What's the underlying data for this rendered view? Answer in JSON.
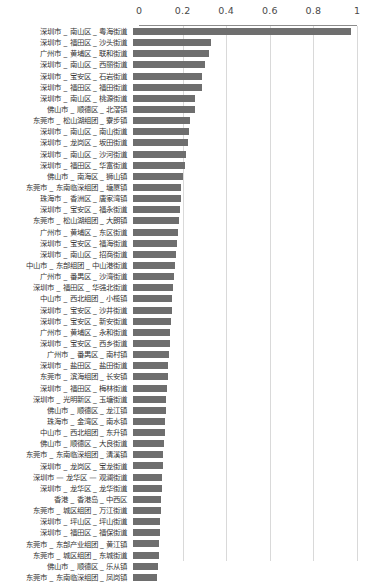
{
  "chart_data": {
    "type": "bar",
    "orientation": "horizontal",
    "title": "",
    "xlabel": "",
    "ylabel": "",
    "xlim": [
      0,
      1
    ],
    "ylim": null,
    "grid": true,
    "legend": null,
    "bar_color": "#6e6e6e",
    "axis_color": "#8c8c8c",
    "grid_color": "#d9d9d9",
    "xticks": [
      "0",
      "0.2",
      "0.4",
      "0.6",
      "0.8",
      "1"
    ],
    "xtick_values": [
      0,
      0.2,
      0.4,
      0.6,
      0.8,
      1
    ],
    "categories": [
      "深圳市 _ 南山区 _ 粤海街道",
      "深圳市 _ 福田区 _ 沙头街道",
      "广州市 _ 黄埔区 _ 联和街道",
      "深圳市 _ 南山区 _ 西丽街道",
      "深圳市 _ 宝安区 _ 石岩街道",
      "深圳市 _ 福田区 _ 福田街道",
      "深圳市 _ 南山区 _ 桃源街道",
      "佛山市 _ 顺德区 _ 北滘镇",
      "东莞市 _ 松山湖组团 _ 寮步镇",
      "深圳市 _ 南山区 _ 南山街道",
      "深圳市 _ 龙岗区 _ 坂田街道",
      "深圳市 _ 南山区 _ 沙河街道",
      "深圳市 _ 福田区 _ 华富街道",
      "佛山市 _ 南海区 _ 狮山镇",
      "东莞市 _ 东南临深组团 _ 塘厦镇",
      "珠海市 _ 香洲区 _ 唐家湾镇",
      "深圳市 _ 宝安区 _ 福永街道",
      "东莞市 _ 松山湖组团 _ 大朗镇",
      "广州市 _ 黄埔区 _ 东区街道",
      "深圳市 _ 宝安区 _ 福海街道",
      "深圳市 _ 南山区 _ 招商街道",
      "中山市 _ 东部组团 _ 中山港街道",
      "广州市 _ 番禺区 _ 沙湾街道",
      "深圳市 _ 福田区 _ 华强北街道",
      "中山市 _ 西北组团 _ 小榄镇",
      "深圳市 _ 宝安区 _ 沙井街道",
      "深圳市 _ 宝安区 _ 新安街道",
      "广州市 _ 黄埔区 _ 永和街道",
      "深圳市 _ 宝安区 _ 西乡街道",
      "广州市 _ 番禺区 _ 南村镇",
      "深圳市 _ 盐田区 _ 盐田街道",
      "东莞市 _ 滨海组团 _ 长安镇",
      "深圳市 _ 福田区 _ 梅林街道",
      "深圳市 _ 光明新区 _ 玉塘街道",
      "佛山市 _ 顺德区 _ 龙江镇",
      "珠海市 _ 金湾区 _ 南水镇",
      "中山市 _ 西北组团 _ 东升镇",
      "佛山市 _ 顺德区 _ 大良街道",
      "东莞市 _ 东南临深组团 _ 清溪镇",
      "深圳市 _ 龙岗区 _ 宝龙街道",
      "深圳市 — 龙华区 — 观澜街道",
      "深圳市 _ 龙华区 _ 龙华街道",
      "香港 _ 香港岛 _ 中西区",
      "东莞市 _ 城区组团 _ 万江街道",
      "深圳市 _ 坪山区 _ 坪山街道",
      "深圳市 _ 福田区 _ 福保街道",
      "东莞市 _ 东部产业组团 _ 黄江镇",
      "东莞市 _ 城区组团 _ 东城街道",
      "佛山市 _ 顺德区 _ 乐从镇",
      "东莞市 _ 东南临深组团 _ 凤岗镇"
    ],
    "values": [
      1.0,
      0.36,
      0.348,
      0.33,
      0.318,
      0.315,
      0.285,
      0.283,
      0.262,
      0.258,
      0.252,
      0.243,
      0.237,
      0.229,
      0.222,
      0.218,
      0.214,
      0.21,
      0.205,
      0.2,
      0.196,
      0.192,
      0.188,
      0.185,
      0.181,
      0.178,
      0.175,
      0.172,
      0.168,
      0.165,
      0.162,
      0.159,
      0.156,
      0.153,
      0.15,
      0.147,
      0.145,
      0.142,
      0.139,
      0.137,
      0.134,
      0.132,
      0.129,
      0.127,
      0.124,
      0.122,
      0.12,
      0.118,
      0.115,
      0.112
    ]
  }
}
